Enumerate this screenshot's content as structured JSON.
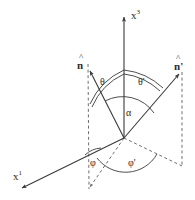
{
  "figure": {
    "background_color": "#ffffff",
    "line_color": "#3a3a3a",
    "dashed_color": "#6e6e6e",
    "text_color": "#2b2b2b",
    "width": 195,
    "height": 200
  },
  "axes": [
    {
      "id": "x3",
      "name": "x3-axis",
      "label_base": "x",
      "label_sup": "3",
      "label_x": 133,
      "label_y": 16,
      "from": {
        "x": 124,
        "y": 138
      },
      "to": {
        "x": 124,
        "y": 16
      },
      "arrow": true
    },
    {
      "id": "x1",
      "name": "x1-axis",
      "label_base": "x",
      "label_sup": "1",
      "label_x": 14,
      "label_y": 177,
      "from": {
        "x": 124,
        "y": 138
      },
      "to": {
        "x": 20,
        "y": 189
      },
      "arrow": true
    }
  ],
  "vectors": [
    {
      "id": "n",
      "name": "incident-direction-vector",
      "label": "n",
      "prime": "",
      "hat": "^",
      "label_x": 80,
      "label_y": 65,
      "from": {
        "x": 124,
        "y": 138
      },
      "to": {
        "x": 89,
        "y": 70
      },
      "arrow": true
    },
    {
      "id": "n-prime",
      "name": "scattered-direction-vector",
      "label": "n",
      "prime": "'",
      "hat": "^",
      "label_x": 176,
      "label_y": 66,
      "from": {
        "x": 124,
        "y": 138
      },
      "to": {
        "x": 180,
        "y": 73
      },
      "arrow": true
    }
  ],
  "angles": [
    {
      "id": "theta",
      "name": "polar-angle-theta",
      "label": "θ",
      "label_x": 103,
      "label_y": 83,
      "description": "polar angle between x3 axis and n"
    },
    {
      "id": "theta-prime",
      "name": "polar-angle-theta-prime",
      "label": "θ'",
      "label_x": 142,
      "label_y": 83,
      "description": "polar angle between x3 axis and n-prime"
    },
    {
      "id": "alpha",
      "name": "scattering-angle-alpha",
      "label": "α",
      "label_x": 129,
      "label_y": 114,
      "description": "angle between n and n-prime"
    },
    {
      "id": "phi",
      "name": "azimuthal-angle-phi",
      "label": "φ",
      "label_x": 93,
      "label_y": 163,
      "description": "azimuthal angle of n measured from x1 axis"
    },
    {
      "id": "phi-prime",
      "name": "azimuthal-angle-phi-prime",
      "label": "φ'",
      "label_x": 131,
      "label_y": 163,
      "description": "azimuthal angle of n-prime measured from x1 axis"
    }
  ],
  "projections": [
    {
      "id": "drop-n",
      "name": "projection-drop-line-n",
      "from": {
        "x": 88,
        "y": 64
      },
      "to": {
        "x": 89,
        "y": 189
      },
      "style": "dashed"
    },
    {
      "id": "drop-n-prime",
      "name": "projection-drop-line-n-prime",
      "from": {
        "x": 182,
        "y": 72
      },
      "to": {
        "x": 182,
        "y": 166
      },
      "style": "dashed"
    },
    {
      "id": "ground-ray-n",
      "name": "ground-projection-ray-n",
      "from": {
        "x": 124,
        "y": 138
      },
      "to": {
        "x": 89,
        "y": 189
      },
      "style": "dashed"
    },
    {
      "id": "ground-ray-n-prime",
      "name": "ground-projection-ray-n-prime",
      "from": {
        "x": 124,
        "y": 138
      },
      "to": {
        "x": 182,
        "y": 166
      },
      "style": "dashed"
    }
  ]
}
